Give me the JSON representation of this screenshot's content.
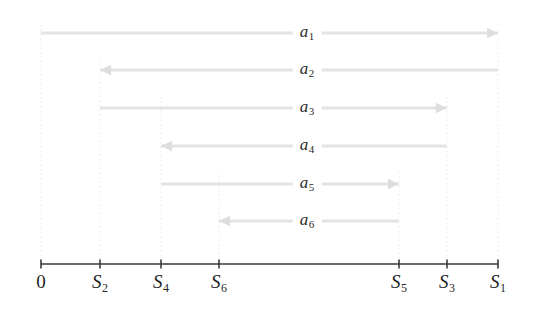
{
  "figure": {
    "width": 539,
    "height": 311,
    "background": "#ffffff"
  },
  "colors": {
    "axis": "#3a3a3a",
    "arrow": "#e3e3e3",
    "arrow_head": "#dedede",
    "dotted_guide": "#e8e8e8",
    "label_text": "#2b2b2b",
    "tick_text": "#1f1f1f"
  },
  "axis": {
    "name": "number-line",
    "y": 264,
    "x_start": 41,
    "x_end": 498,
    "tick_height": 9,
    "ticks": [
      {
        "id": "tick-0",
        "label": "0",
        "sub": "",
        "x": 41
      },
      {
        "id": "tick-s2",
        "label": "S",
        "sub": "2",
        "x": 100
      },
      {
        "id": "tick-s4",
        "label": "S",
        "sub": "4",
        "x": 161
      },
      {
        "id": "tick-s6",
        "label": "S",
        "sub": "6",
        "x": 219
      },
      {
        "id": "tick-s5",
        "label": "S",
        "sub": "5",
        "x": 399
      },
      {
        "id": "tick-s3",
        "label": "S",
        "sub": "3",
        "x": 447
      },
      {
        "id": "tick-s1",
        "label": "S",
        "sub": "1",
        "x": 498
      }
    ],
    "tick_label_y": 272
  },
  "guides": [
    {
      "name": "guide-0",
      "x": 41,
      "y_top": 25,
      "y_bottom": 260
    },
    {
      "name": "guide-s2",
      "x": 100,
      "y_top": 60,
      "y_bottom": 260
    },
    {
      "name": "guide-s4",
      "x": 161,
      "y_top": 97,
      "y_bottom": 260
    },
    {
      "name": "guide-s6",
      "x": 219,
      "y_top": 172,
      "y_bottom": 260
    },
    {
      "name": "guide-s5",
      "x": 399,
      "y_top": 172,
      "y_bottom": 260
    },
    {
      "name": "guide-s3",
      "x": 447,
      "y_top": 97,
      "y_bottom": 260
    },
    {
      "name": "guide-s1",
      "x": 498,
      "y_top": 25,
      "y_bottom": 260
    }
  ],
  "arrows": [
    {
      "id": "arrow-a1",
      "label": "a",
      "sub": "1",
      "y": 33,
      "x_left": 41,
      "x_right": 498,
      "direction": "right",
      "from": "0",
      "to": "S1",
      "label_x": 307
    },
    {
      "id": "arrow-a2",
      "label": "a",
      "sub": "2",
      "y": 70,
      "x_left": 100,
      "x_right": 498,
      "direction": "left",
      "from": "S1",
      "to": "S2",
      "label_x": 307
    },
    {
      "id": "arrow-a3",
      "label": "a",
      "sub": "3",
      "y": 108,
      "x_left": 100,
      "x_right": 447,
      "direction": "right",
      "from": "S2",
      "to": "S3",
      "label_x": 307
    },
    {
      "id": "arrow-a4",
      "label": "a",
      "sub": "4",
      "y": 146,
      "x_left": 161,
      "x_right": 447,
      "direction": "left",
      "from": "S3",
      "to": "S4",
      "label_x": 307
    },
    {
      "id": "arrow-a5",
      "label": "a",
      "sub": "5",
      "y": 184,
      "x_left": 161,
      "x_right": 399,
      "direction": "right",
      "from": "S4",
      "to": "S5",
      "label_x": 307
    },
    {
      "id": "arrow-a6",
      "label": "a",
      "sub": "6",
      "y": 221,
      "x_left": 219,
      "x_right": 399,
      "direction": "left",
      "from": "S5",
      "to": "S6",
      "label_x": 307
    }
  ],
  "labels": {
    "a1": "a",
    "a1_sub": "1",
    "a2": "a",
    "a2_sub": "2",
    "a3": "a",
    "a3_sub": "3",
    "a4": "a",
    "a4_sub": "4",
    "a5": "a",
    "a5_sub": "5",
    "a6": "a",
    "a6_sub": "6",
    "t0": "0",
    "t_s2": "S",
    "t_s2_sub": "2",
    "t_s4": "S",
    "t_s4_sub": "4",
    "t_s6": "S",
    "t_s6_sub": "6",
    "t_s5": "S",
    "t_s5_sub": "5",
    "t_s3": "S",
    "t_s3_sub": "3",
    "t_s1": "S",
    "t_s1_sub": "1"
  }
}
